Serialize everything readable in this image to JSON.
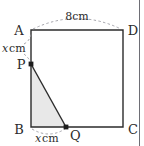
{
  "figure": {
    "kind": "geometry-diagram",
    "shape": "square",
    "vertices": [
      {
        "id": "A",
        "label": "A",
        "position": "top-left"
      },
      {
        "id": "D",
        "label": "D",
        "position": "top-right"
      },
      {
        "id": "C",
        "label": "C",
        "position": "bottom-right"
      },
      {
        "id": "B",
        "label": "B",
        "position": "bottom-left"
      }
    ],
    "points": [
      {
        "id": "P",
        "label": "P",
        "on_segment": "AB"
      },
      {
        "id": "Q",
        "label": "Q",
        "on_segment": "BC"
      }
    ],
    "measures": [
      {
        "id": "top",
        "segment": "AD",
        "value": "8",
        "unit": "cm",
        "text": "8cm"
      },
      {
        "id": "left",
        "segment": "AP",
        "value": "x",
        "unit": "cm",
        "var": "x",
        "unit_text": "cm"
      },
      {
        "id": "bottom",
        "segment": "BQ",
        "value": "x",
        "unit": "cm",
        "var": "x",
        "unit_text": "cm"
      }
    ],
    "shaded_region": {
      "id": "triangle-PBQ",
      "vertices": [
        "P",
        "B",
        "Q"
      ],
      "fill": "#e8e8e8"
    },
    "colors": {
      "stroke": "#2b2b2b",
      "dashed": "#9a9aa2",
      "shade": "#e8e8e8",
      "text": "#2b2b2b",
      "frame": "#6e6e75"
    }
  }
}
